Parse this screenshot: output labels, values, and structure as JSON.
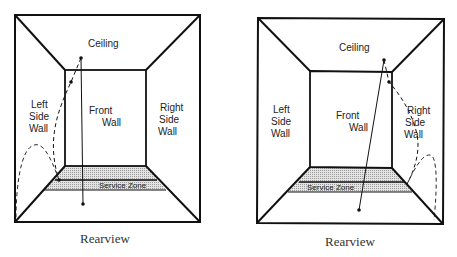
{
  "diagrams": [
    {
      "caption": "Rearview",
      "labels": {
        "ceiling": "Ceiling",
        "front_wall_1": "Front",
        "front_wall_2": "Wall",
        "left_wall_1": "Left",
        "left_wall_2": "Side",
        "left_wall_3": "Wall",
        "right_wall_1": "Right",
        "right_wall_2": "Side",
        "right_wall_3": "Wall",
        "service_zone": "Service Zone"
      },
      "ball_path": "left side wall bounce"
    },
    {
      "caption": "Rearview",
      "labels": {
        "ceiling": "Ceiling",
        "front_wall_1": "Front",
        "front_wall_2": "Wall",
        "left_wall_1": "Left",
        "left_wall_2": "Side",
        "left_wall_3": "Wall",
        "right_wall_1": "Right",
        "right_wall_2": "Side",
        "right_wall_3": "Wall",
        "service_zone": "Service Zone"
      },
      "ball_path": "right side wall bounce"
    }
  ],
  "colors": {
    "line": "#111111",
    "zone_fill": "#cfcfcf"
  }
}
